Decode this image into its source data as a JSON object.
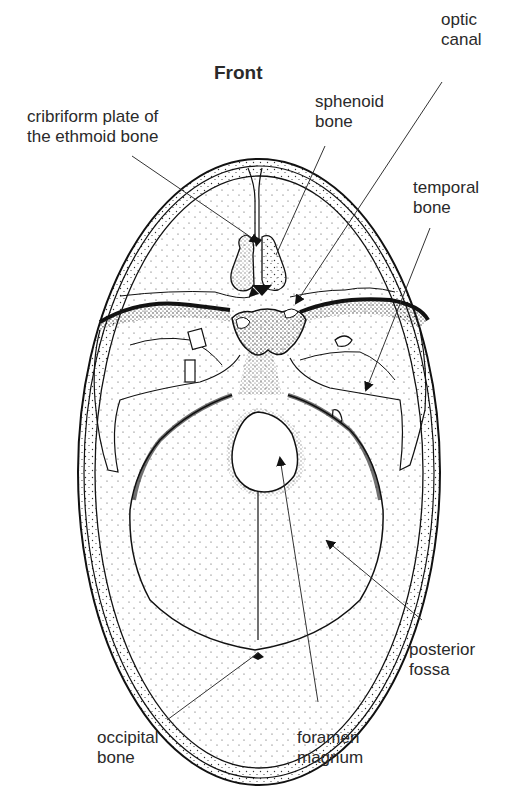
{
  "diagram": {
    "title": "Front",
    "labels": {
      "optic_canal": {
        "line1": "optic",
        "line2": "canal"
      },
      "sphenoid_bone": {
        "line1": "sphenoid",
        "line2": "bone"
      },
      "cribriform_plate": {
        "line1": "cribriform plate of",
        "line2": "the ethmoid bone"
      },
      "temporal_bone": {
        "line1": "temporal",
        "line2": "bone"
      },
      "posterior_fossa": {
        "line1": "posterior",
        "line2": "fossa"
      },
      "occipital_bone": {
        "line1": "occipital",
        "line2": "bone"
      },
      "foramen_magnum": {
        "line1": "foramen",
        "line2": "magnum"
      }
    },
    "colors": {
      "ink": "#222222",
      "background": "#ffffff",
      "stipple": "#333333"
    }
  }
}
